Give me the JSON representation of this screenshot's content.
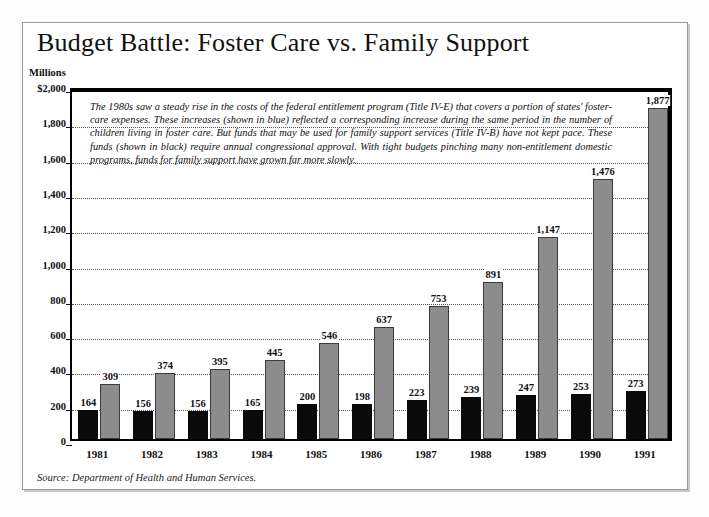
{
  "figure": {
    "title": "Budget Battle: Foster Care vs. Family Support",
    "y_unit_label": "Millions",
    "caption": "The 1980s saw a steady rise in the costs of the federal entitlement program (Title IV-E) that covers a portion of states' foster-care expenses. These increases (shown in blue) reflected a corresponding increase during the same period in the number of children living in foster care. But funds that may be used for family support services (Title IV-B) have not kept pace. These funds (shown in black) require annual congressional approval. With tight budgets pinching many non-entitlement domestic programs, funds for family support have grown far more slowly.",
    "source": "Source: Department of Health and Human Services.",
    "colors": {
      "foster_care_bar": "#8c8c8c",
      "family_support_bar": "#0a0a0a",
      "frame": "#9a9a9a",
      "axis": "#000000",
      "gridline": "#555555"
    }
  },
  "chart_data": {
    "type": "bar",
    "title": "Budget Battle: Foster Care vs. Family Support",
    "xlabel": "",
    "ylabel": "Millions",
    "ylim": [
      0,
      2000
    ],
    "grid": true,
    "legend_position": "none",
    "ytick_labels": [
      "$2,000",
      "1,800",
      "1,600",
      "1,400",
      "1,200",
      "1,000",
      "800",
      "600",
      "400",
      "200",
      "0"
    ],
    "ytick_values": [
      2000,
      1800,
      1600,
      1400,
      1200,
      1000,
      800,
      600,
      400,
      200,
      0
    ],
    "categories": [
      "1981",
      "1982",
      "1983",
      "1984",
      "1985",
      "1986",
      "1987",
      "1988",
      "1989",
      "1990",
      "1991"
    ],
    "series": [
      {
        "name": "Family Support (Title IV-B)",
        "color": "#0a0a0a",
        "values": [
          164,
          156,
          156,
          165,
          200,
          198,
          223,
          239,
          247,
          253,
          273
        ],
        "labels": [
          "164",
          "156",
          "156",
          "165",
          "200",
          "198",
          "223",
          "239",
          "247",
          "253",
          "273"
        ]
      },
      {
        "name": "Foster Care (Title IV-E)",
        "color": "#8c8c8c",
        "values": [
          309,
          374,
          395,
          445,
          546,
          637,
          753,
          891,
          1147,
          1476,
          1877
        ],
        "labels": [
          "309",
          "374",
          "395",
          "445",
          "546",
          "637",
          "753",
          "891",
          "1,147",
          "1,476",
          "1,877"
        ]
      }
    ],
    "annotations": [
      "The 1980s saw a steady rise in the costs of the federal entitlement program (Title IV-E) that covers a portion of states' foster-care expenses. These increases (shown in blue) reflected a corresponding increase during the same period in the number of children living in foster care. But funds that may be used for family support services (Title IV-B) have not kept pace. These funds (shown in black) require annual congressional approval. With tight budgets pinching many non-entitlement domestic programs, funds for family support have grown far more slowly."
    ]
  }
}
